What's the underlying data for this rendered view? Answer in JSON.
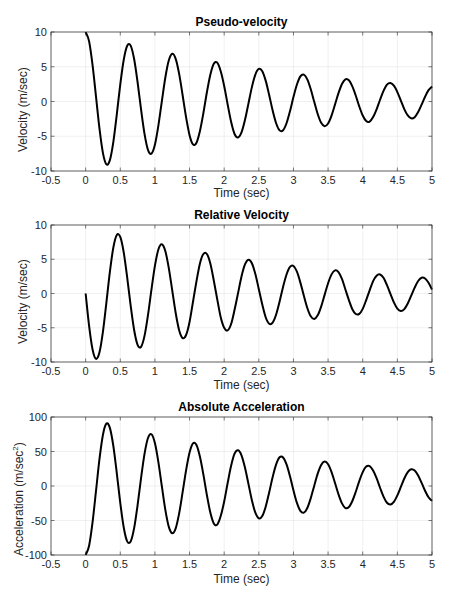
{
  "chart_data": [
    {
      "type": "line",
      "title": "Pseudo-velocity",
      "xlabel": "Time (sec)",
      "ylabel": "Velocity (m/sec)",
      "ylabel_sup": "",
      "xlim": [
        -0.5,
        5
      ],
      "ylim": [
        -10,
        10
      ],
      "xticks": [
        -0.5,
        0,
        0.5,
        1,
        1.5,
        2,
        2.5,
        3,
        3.5,
        4,
        4.5,
        5
      ],
      "xtick_labels": [
        "-0.5",
        "0",
        "0.5",
        "1",
        "1.5",
        "2",
        "2.5",
        "3",
        "3.5",
        "4",
        "4.5",
        "5"
      ],
      "yticks": [
        -10,
        -5,
        0,
        5,
        10
      ],
      "ytick_labels": [
        "-10",
        "-5",
        "0",
        "5",
        "10"
      ],
      "grid": true,
      "legend": null,
      "series": [
        {
          "name": "Pseudo-velocity",
          "color": "#000000",
          "x_start": 0,
          "x_step": 0.05,
          "values": [
            10,
            8.65,
            5.24,
            0.68,
            -3.92,
            -7.43,
            -9.05,
            -8.43,
            -5.8,
            -1.84,
            2.44,
            6.01,
            8.02,
            8.04,
            6.11,
            2.77,
            -1.14,
            -4.66,
            -6.96,
            -7.5,
            -6.22,
            -3.47,
            0.03,
            3.42,
            5.89,
            6.86,
            6.14,
            3.97,
            0.9,
            -2.27,
            -4.84,
            -6.17,
            -5.93,
            -4.23,
            -1.65,
            1.3,
            3.85,
            5.42,
            5.59,
            4.36,
            2.24,
            -0.43,
            -2.92,
            -4.68,
            -5.17,
            -4.45,
            -2.67,
            -0.31,
            2.07,
            3.87,
            4.68,
            4.36,
            2.97,
            0.91,
            -1.3,
            -3.13,
            -4.16,
            -4.14,
            -3.13,
            -1.4,
            0.63,
            2.44,
            3.61,
            3.87,
            3.19,
            1.76,
            -0.05,
            -1.8,
            -3.06,
            -3.55,
            -3.16,
            -2.02,
            -0.43,
            1.2,
            2.52,
            3.19,
            3.05,
            2.17,
            0.83,
            -0.7,
            -2.01,
            -2.81,
            -2.89,
            -2.24,
            -1.13,
            0.25,
            1.53,
            2.43,
            2.67,
            2.29,
            1.36,
            0.14,
            -1.09,
            -2.01,
            -2.42,
            -2.25,
            -1.52,
            -0.45,
            0.69,
            1.63,
            2.15
          ]
        }
      ]
    },
    {
      "type": "line",
      "title": "Relative Velocity",
      "xlabel": "Time (sec)",
      "ylabel": "Velocity (m/sec)",
      "ylabel_sup": "",
      "xlim": [
        -0.5,
        5
      ],
      "ylim": [
        -10,
        10
      ],
      "xticks": [
        -0.5,
        0,
        0.5,
        1,
        1.5,
        2,
        2.5,
        3,
        3.5,
        4,
        4.5,
        5
      ],
      "xtick_labels": [
        "-0.5",
        "0",
        "0.5",
        "1",
        "1.5",
        "2",
        "2.5",
        "3",
        "3.5",
        "4",
        "4.5",
        "5"
      ],
      "yticks": [
        -10,
        -5,
        0,
        5,
        10
      ],
      "ytick_labels": [
        "-10",
        "-5",
        "0",
        "5",
        "10"
      ],
      "grid": true,
      "legend": null,
      "series": [
        {
          "name": "Relative Velocity",
          "color": "#000000",
          "x_start": 0,
          "x_step": 0.05,
          "values": [
            0,
            -4.72,
            -8.17,
            -9.54,
            -8.56,
            -5.55,
            -1.29,
            3.16,
            6.71,
            8.54,
            8.25,
            5.98,
            2.33,
            -1.77,
            -5.33,
            -7.49,
            -7.78,
            -6.19,
            -3.15,
            0.57,
            4.03,
            6.42,
            7.19,
            6.2,
            3.74,
            0.46,
            -2.85,
            -5.36,
            -6.51,
            -6.06,
            -4.15,
            -1.2,
            1.78,
            4.39,
            5.77,
            5.77,
            4.38,
            1.9,
            -0.85,
            -3.47,
            -5.01,
            -5.39,
            -4.46,
            -2.38,
            0.05,
            2.48,
            4.24,
            4.93,
            4.41,
            2.84,
            0.63,
            -1.62,
            -3.5,
            -4.42,
            -4.25,
            -3.07,
            -1.17,
            0.96,
            2.78,
            3.88,
            4.02,
            3.18,
            1.59,
            -0.33,
            -2.11,
            -3.33,
            -3.72,
            -3.19,
            -1.91,
            -0.2,
            1.5,
            2.79,
            3.37,
            3.12,
            2.12,
            0.59,
            -0.95,
            -2.29,
            -2.99,
            -2.98,
            -2.24,
            -0.96,
            0.46,
            1.81,
            2.6,
            2.78,
            2.29,
            1.21,
            -0.05,
            -1.3,
            -2.21,
            -2.55,
            -2.27,
            -1.45,
            -0.3,
            0.85,
            1.82,
            2.29,
            2.19,
            1.57,
            0.59
          ]
        }
      ]
    },
    {
      "type": "line",
      "title": "Absolute Acceleration",
      "xlabel": "Time (sec)",
      "ylabel": "Acceleration (m/sec",
      "ylabel_sup": "2",
      "ylabel_tail": ")",
      "xlim": [
        -0.5,
        5
      ],
      "ylim": [
        -100,
        100
      ],
      "xticks": [
        -0.5,
        0,
        0.5,
        1,
        1.5,
        2,
        2.5,
        3,
        3.5,
        4,
        4.5,
        5
      ],
      "xtick_labels": [
        "-0.5",
        "0",
        "0.5",
        "1",
        "1.5",
        "2",
        "2.5",
        "3",
        "3.5",
        "4",
        "4.5",
        "5"
      ],
      "yticks": [
        -100,
        -50,
        0,
        50,
        100
      ],
      "ytick_labels": [
        "-100",
        "-50",
        "0",
        "50",
        "100"
      ],
      "grid": true,
      "legend": null,
      "series": [
        {
          "name": "Absolute Acceleration",
          "color": "#000000",
          "x_start": 0,
          "x_step": 0.05,
          "values": [
            -100,
            -86.5,
            -52.4,
            -6.8,
            39.2,
            74.3,
            90.5,
            84.3,
            58.0,
            18.4,
            -24.4,
            -60.1,
            -80.2,
            -80.4,
            -61.1,
            -27.7,
            11.4,
            46.6,
            69.6,
            75.0,
            62.2,
            34.7,
            -0.3,
            -34.2,
            -58.9,
            -68.6,
            -61.4,
            -39.7,
            -9.0,
            22.7,
            48.4,
            61.7,
            59.3,
            42.3,
            16.5,
            -13.0,
            -38.5,
            -54.2,
            -55.9,
            -43.6,
            -22.4,
            4.3,
            29.2,
            46.8,
            51.7,
            44.5,
            26.7,
            3.1,
            -20.7,
            -38.7,
            -46.8,
            -43.6,
            -29.7,
            -9.1,
            13.0,
            31.3,
            41.6,
            41.4,
            31.3,
            14.0,
            -6.3,
            -24.4,
            -36.1,
            -38.7,
            -31.9,
            -17.6,
            0.5,
            18.0,
            30.6,
            35.5,
            31.6,
            20.2,
            4.3,
            -12.0,
            -25.2,
            -31.9,
            -30.5,
            -21.7,
            -8.3,
            7.0,
            20.1,
            28.1,
            28.9,
            22.4,
            11.3,
            -2.5,
            -15.3,
            -24.3,
            -26.7,
            -22.9,
            -13.6,
            -1.4,
            10.9,
            20.1,
            24.2,
            22.5,
            15.2,
            4.5,
            -6.9,
            -16.3,
            -21.5
          ]
        }
      ]
    }
  ],
  "style": {
    "axis_color": "#262626",
    "grid_color": "#e6e6e6",
    "line_color": "#000000",
    "background": "#ffffff"
  }
}
